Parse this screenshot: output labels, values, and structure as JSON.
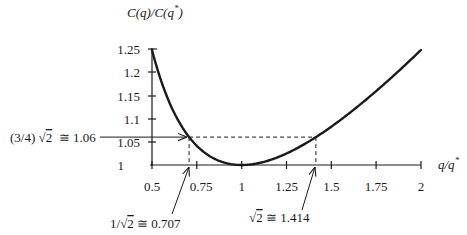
{
  "chart_data": {
    "type": "line",
    "title": "",
    "ylabel": "C(q)/C(q*)",
    "xlabel": "q/q*",
    "xlim": [
      0.5,
      2
    ],
    "ylim": [
      1,
      1.25
    ],
    "x_ticks": [
      "0.5",
      "0.75",
      "1",
      "1.25",
      "1.5",
      "1.75",
      "2"
    ],
    "y_ticks": [
      "1",
      "1.05",
      "1.1",
      "1.15",
      "1.2",
      "1.25"
    ],
    "grid": false,
    "legend": null,
    "series": [
      {
        "name": "C(q)/C(q*) = (q/q* + q*/q)/2",
        "x": [
          0.5,
          0.55,
          0.6,
          0.65,
          0.7,
          0.75,
          0.8,
          0.85,
          0.9,
          0.95,
          1.0,
          1.1,
          1.2,
          1.3,
          1.4,
          1.5,
          1.6,
          1.7,
          1.8,
          1.9,
          2.0
        ],
        "values": [
          1.25,
          1.184,
          1.133,
          1.094,
          1.064,
          1.042,
          1.025,
          1.013,
          1.006,
          1.001,
          1.0,
          1.005,
          1.017,
          1.035,
          1.057,
          1.083,
          1.113,
          1.144,
          1.178,
          1.213,
          1.25
        ]
      }
    ],
    "reference_lines": {
      "horizontal_y": 1.06,
      "vertical_x": [
        0.707,
        1.414
      ],
      "style": "dashed"
    },
    "annotations": [
      {
        "text_prefix": "(3/4) ",
        "radical": "2",
        "text_suffix": "  ≅ 1.06",
        "points_to": [
          0.707,
          1.06
        ]
      },
      {
        "text_prefix": "1/",
        "radical": "2",
        "text_suffix": " ≅ 0.707",
        "points_to": [
          0.707,
          1.0
        ]
      },
      {
        "text_prefix": "",
        "radical": "2",
        "text_suffix": " ≅ 1.414",
        "points_to": [
          1.414,
          1.0
        ]
      }
    ]
  },
  "labels": {
    "y_axis_title": {
      "base": "C(q)/C(q",
      "sup": "*",
      "close": ")"
    },
    "x_axis_title": {
      "base": "q/q",
      "sup": "*"
    },
    "ann_y": {
      "pre": "(3/4) ",
      "rad": "√",
      "radicand": "2",
      "post": "  ≅ 1.06"
    },
    "ann_x1": {
      "pre": "1/",
      "rad": "√",
      "radicand": "2",
      "post": " ≅ 0.707"
    },
    "ann_x2": {
      "pre": "",
      "rad": "√",
      "radicand": "2",
      "post": " ≅ 1.414"
    }
  },
  "colors": {
    "ink": "#1a1a1a",
    "background": "#ffffff"
  }
}
